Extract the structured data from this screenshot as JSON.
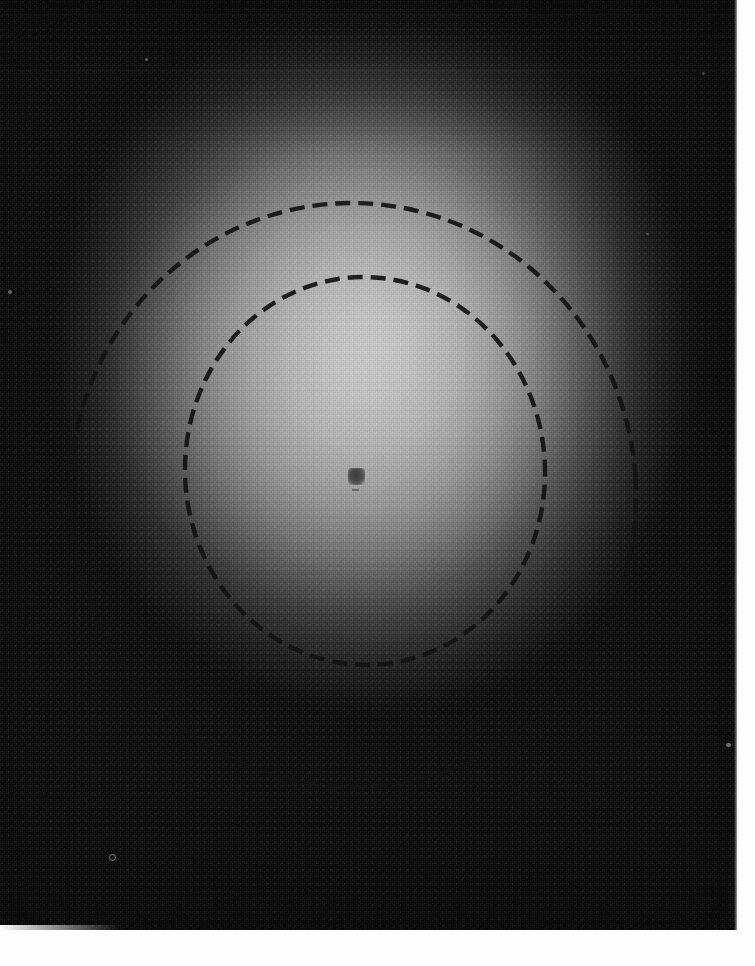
{
  "image": {
    "kind": "scanned-photographic-plate",
    "title": "Scanned photographic plate with annotated dashed circles",
    "width_px": 755,
    "height_px": 966,
    "background_color": "#050505",
    "paper_margin_color": "#fdfdfd",
    "description": "Dark photographic emulsion showing a broad diffuse radial halo that is brightest near the centre and fades to near black at the edges. Two hand-drawn dashed circles are overlaid concentrically around a small dark central spot."
  },
  "emulsion": {
    "label": "emulsion-area",
    "left_px": 0,
    "top_px": 0,
    "width_px": 738,
    "height_px": 931,
    "halo": {
      "label": "diffuse-radial-halo",
      "center_x_px": 363,
      "center_y_px": 448,
      "peak_brightness_hex": "#c2c2c2",
      "mid_brightness_hex": "#8b8b8b",
      "edge_brightness_hex": "#0b0b0b",
      "falloff": "radial, ellipse 330x370 px core"
    },
    "grain": {
      "label": "film-grain",
      "opacity": 0.3,
      "coarse_opacity": 0.16
    },
    "scanlines": [
      {
        "name": "scanline-top-1",
        "y_px": 14
      },
      {
        "name": "scanline-top-2",
        "y_px": 70
      },
      {
        "name": "scanline-mid-1",
        "y_px": 322
      },
      {
        "name": "scanline-mid-2",
        "y_px": 628
      }
    ]
  },
  "annotations": {
    "label": "dashed-circle-annotations",
    "stroke_color": "#131313",
    "stroke_width_px": 4.4,
    "dash_length_px": 15,
    "dash_gap_px": 8,
    "circles": [
      {
        "name": "outer-dashed-circle",
        "center_x_px": 353,
        "center_y_px": 495,
        "radius_x_px": 283,
        "radius_y_px": 292,
        "rotation_deg": -4,
        "top_px": 203,
        "bottom_px": 787,
        "left_px": 70,
        "right_px": 636
      },
      {
        "name": "inner-dashed-circle",
        "center_x_px": 365,
        "center_y_px": 471,
        "radius_x_px": 180,
        "radius_y_px": 194,
        "rotation_deg": -3,
        "top_px": 277,
        "bottom_px": 665,
        "left_px": 185,
        "right_px": 545
      }
    ]
  },
  "center_spot": {
    "name": "central-dark-spot",
    "x_px": 357,
    "y_px": 477,
    "width_px": 17,
    "height_px": 17,
    "color_hex": "#3c3c3c",
    "shape": "soft-edged rounded square"
  },
  "specks": [
    {
      "name": "dust-speck-top-left",
      "x_px": 145,
      "y_px": 58,
      "size_px": 3,
      "color_hex": "#6e6e6e"
    },
    {
      "name": "dust-speck-left-mid",
      "x_px": 8,
      "y_px": 290,
      "size_px": 4,
      "color_hex": "#8a8a8a"
    },
    {
      "name": "dust-speck-bottom-left",
      "x_px": 111,
      "y_px": 856,
      "size_px": 5,
      "color_hex": "#9a9a9a"
    },
    {
      "name": "dust-speck-right-upper",
      "x_px": 702,
      "y_px": 72,
      "size_px": 3,
      "color_hex": "#5f5f5f"
    },
    {
      "name": "dust-speck-right-lower",
      "x_px": 728,
      "y_px": 745,
      "size_px": 4,
      "color_hex": "#8f8f8f"
    },
    {
      "name": "dust-speck-right-mid",
      "x_px": 646,
      "y_px": 233,
      "size_px": 3,
      "color_hex": "#707070"
    }
  ],
  "margins": {
    "bottom": {
      "name": "paper-margin-bottom",
      "height_px": 36,
      "color_hex": "#fdfdfd"
    },
    "right": {
      "name": "paper-margin-right",
      "width_px": 18,
      "color_hex": "#fdfdfd"
    }
  }
}
